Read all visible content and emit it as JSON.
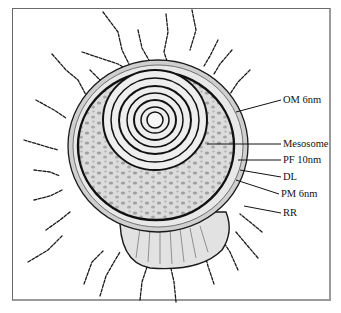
{
  "diagram": {
    "labels": [
      {
        "id": "om",
        "text": "OM 6nm",
        "x": 283,
        "y": 94
      },
      {
        "id": "mesosome",
        "text": "Mesosome",
        "x": 283,
        "y": 138
      },
      {
        "id": "pf",
        "text": "PF 10nm",
        "x": 283,
        "y": 154
      },
      {
        "id": "dl",
        "text": "DL",
        "x": 283,
        "y": 171
      },
      {
        "id": "pm",
        "text": "PM 6nm",
        "x": 281,
        "y": 188
      },
      {
        "id": "rr",
        "text": "RR",
        "x": 283,
        "y": 207
      }
    ],
    "colors": {
      "ink": "#111111",
      "cytoplasm": "#d6d6d6",
      "granule": "#9a9a9a",
      "envelope": "#c8c8c8",
      "background": "#ffffff"
    }
  }
}
